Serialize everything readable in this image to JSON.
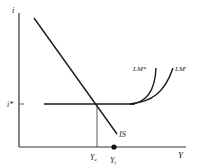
{
  "diagram": {
    "type": "IS-LM",
    "colors": {
      "line": "#1a1a1a",
      "axis": "#333333",
      "background": "#ffffff"
    },
    "axes": {
      "y_label": "i",
      "x_label": "Y"
    },
    "tick_labels": {
      "interest_rate": "i*",
      "y_e": "Y",
      "y_e_sub": "e",
      "y_f": "Y",
      "y_f_sub": "f"
    },
    "curves": {
      "is": "IS",
      "lm_star": "LM*",
      "lm_prime": "LM'"
    }
  }
}
